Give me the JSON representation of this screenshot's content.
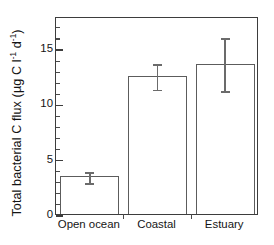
{
  "chart_data": {
    "type": "bar",
    "title": "",
    "subtitle": "",
    "xlabel": "",
    "ylabel": "Total bacterial C flux (µg C l-1 d-1)",
    "ylabel_parts": {
      "prefix": "Total bacterial C flux (µg C l",
      "sup1": "-1",
      "middle": " d",
      "sup2": "-1",
      "suffix": ")"
    },
    "categories": [
      "Open ocean",
      "Coastal",
      "Estuary"
    ],
    "values": [
      3.4,
      12.5,
      13.6
    ],
    "errors": [
      0.5,
      1.15,
      2.4
    ],
    "error_type": "symmetric",
    "ylim": [
      0,
      17.9
    ],
    "yticks": [
      0,
      5,
      10,
      15
    ],
    "ytick_labels": [
      "0",
      "5",
      "10",
      "15"
    ],
    "yminor_step": 1,
    "grid": false,
    "legend": null,
    "bar_facecolor": "#ffffff",
    "bar_edgecolor": "#5c5c5c",
    "error_color": "#6b6b6b",
    "axis_color": "#3d3d3d",
    "text_color": "#141414",
    "background": "#ffffff"
  },
  "figure": {
    "width": 274,
    "height": 245
  }
}
